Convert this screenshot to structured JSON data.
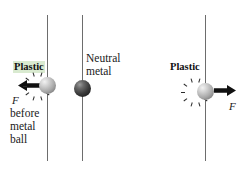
{
  "figure": {
    "background_color": "#ffffff",
    "line_color": "#6d6d6d"
  },
  "panels": {
    "left": {
      "material_label": "Plastic",
      "material_label_highlight": "#d9ead0",
      "force_symbol": "F",
      "caption_lines": [
        "before",
        "metal",
        "ball"
      ],
      "arrow_direction": "left",
      "arrow_color": "#111111",
      "sphere": {
        "name": "charged-plastic-ball",
        "charged": "true",
        "charge_marks": 10
      }
    },
    "middle": {
      "material_label_lines": [
        "Neutral",
        "metal"
      ],
      "sphere": {
        "name": "neutral-metal-ball",
        "charged": "false",
        "color": "#2b2b2b"
      }
    },
    "right": {
      "material_label": "Plastic",
      "force_symbol": "F",
      "arrow_direction": "right",
      "arrow_color": "#111111",
      "sphere": {
        "name": "charged-plastic-ball",
        "charged": "true",
        "charge_marks": 10
      }
    }
  },
  "guide_lines": {
    "count": 3,
    "label": "vertical reference line"
  }
}
